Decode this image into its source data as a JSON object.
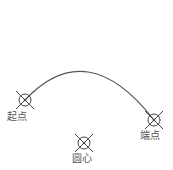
{
  "diagram": {
    "type": "arc-three-point",
    "arc": {
      "start": [
        25,
        100
      ],
      "control": [
        87,
        34
      ],
      "end": [
        154,
        120
      ],
      "stroke": "#555555"
    },
    "points": [
      {
        "id": "start",
        "label": "起点",
        "x": 25,
        "y": 100,
        "label_x": 7,
        "label_y": 111
      },
      {
        "id": "end",
        "label": "端点",
        "x": 154,
        "y": 120,
        "label_x": 140,
        "label_y": 130
      },
      {
        "id": "center",
        "label": "圆心",
        "x": 84,
        "y": 143,
        "label_x": 72,
        "label_y": 153
      }
    ],
    "marker_color": "#444444"
  }
}
